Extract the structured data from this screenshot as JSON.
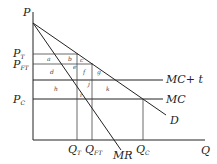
{
  "diagram": {
    "axes": {
      "y_label": "P",
      "x_label": "Q"
    },
    "price_labels": {
      "p_t": {
        "main": "P",
        "sub": "T"
      },
      "p_ft": {
        "main": "P",
        "sub": "FT"
      },
      "p_c": {
        "main": "P",
        "sub": "C"
      }
    },
    "quantity_labels": {
      "q_t": {
        "main": "Q",
        "sub": "T"
      },
      "q_ft": {
        "main": "Q",
        "sub": "FT"
      },
      "q_c": {
        "main": "Q",
        "sub": "C"
      }
    },
    "curves": {
      "mc_t": "MC+ t",
      "mc": "MC",
      "demand": "D",
      "mr": "MR"
    },
    "areas": {
      "a": "a",
      "b": "b",
      "c": "c",
      "d": "d",
      "e": "e",
      "f": "f",
      "g": "g",
      "h": "h",
      "i": "i",
      "j": "j",
      "k": "k"
    }
  }
}
